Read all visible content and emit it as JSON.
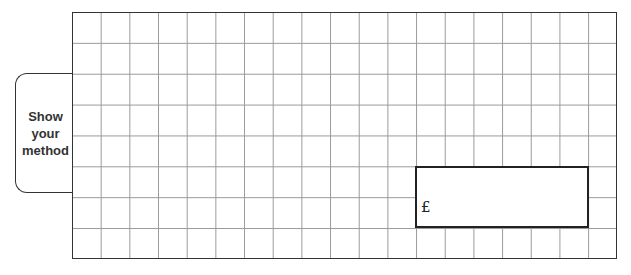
{
  "method_tab": {
    "lines": [
      "Show",
      "your",
      "method"
    ]
  },
  "working_grid": {
    "columns": 19,
    "rows": 8,
    "line_color": "#9a9a9a",
    "border_color": "#333333"
  },
  "answer_box": {
    "currency_symbol": "£",
    "value": ""
  }
}
